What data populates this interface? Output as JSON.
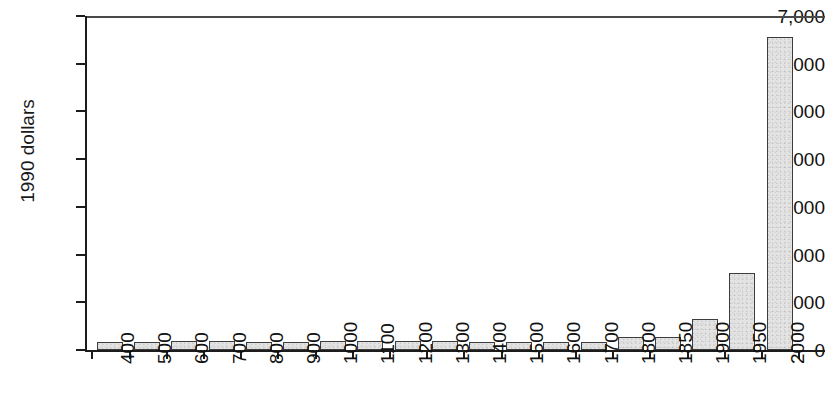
{
  "chart_data": {
    "type": "bar",
    "title": "",
    "subtitle": "",
    "xlabel": "",
    "ylabel": "1990 dollars",
    "ylim": [
      0,
      7000
    ],
    "ytick_values": [
      0,
      1000,
      2000,
      3000,
      4000,
      5000,
      6000,
      7000
    ],
    "ytick_labels": [
      "0",
      "1,000",
      "2,000",
      "3,000",
      "4,000",
      "5,000",
      "6,000",
      "7,000"
    ],
    "grid": false,
    "legend": null,
    "categories": [
      "400",
      "500",
      "600",
      "700",
      "800",
      "900",
      "1000",
      "1100",
      "1200",
      "1300",
      "1400",
      "1500",
      "1600",
      "1700",
      "1800",
      "1850",
      "1900",
      "1950",
      "2000"
    ],
    "values": [
      160,
      175,
      180,
      180,
      175,
      175,
      180,
      180,
      180,
      180,
      175,
      175,
      170,
      165,
      270,
      275,
      640,
      1620,
      6550
    ],
    "bar_fill_color": "#e3e3e3",
    "bar_edge_color": "#3d3d3d",
    "axis_color": "#1c1c1c",
    "background_color": "#ffffff"
  }
}
